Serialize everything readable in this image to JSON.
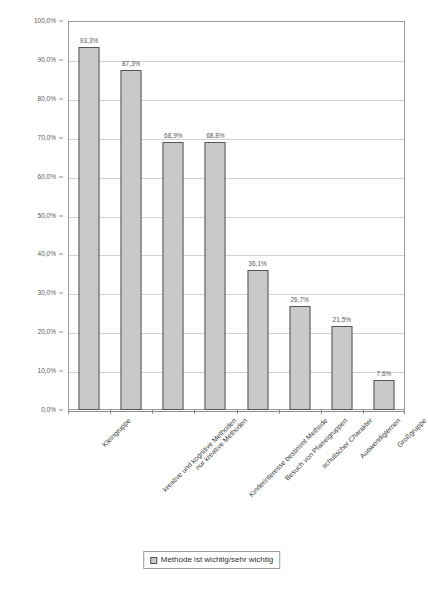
{
  "chart_data": {
    "type": "bar",
    "title": "",
    "subtitle": "",
    "xlabel": "",
    "ylabel": "",
    "ylim": [
      0,
      100
    ],
    "grid": true,
    "legend_position": "bottom",
    "value_suffix": "%",
    "decimal_separator": ",",
    "categories": [
      "Kleingruppe",
      "kreative und kognitive Methoden",
      "nur kreative Methoden",
      "Kinderinteresse bestimmt Methode",
      "Besuch von Pfarreigruppen",
      "schulischer Charakter",
      "Auswendiglernen",
      "Großgruppe"
    ],
    "values": [
      93.3,
      87.3,
      68.9,
      68.8,
      36.1,
      26.7,
      21.5,
      7.6
    ],
    "value_labels": [
      "93,3%",
      "87,3%",
      "68,9%",
      "68,8%",
      "36,1%",
      "26,7%",
      "21,5%",
      "7,6%"
    ],
    "series": [
      {
        "name": "Methode ist wichtig/sehr wichtig",
        "values": [
          93.3,
          87.3,
          68.9,
          68.8,
          36.1,
          26.7,
          21.5,
          7.6
        ],
        "color": "#c9c9c9",
        "border_color": "#555555"
      }
    ],
    "y_ticks": [
      0,
      10,
      20,
      30,
      40,
      50,
      60,
      70,
      80,
      90,
      100
    ],
    "y_tick_labels": [
      "0,0%",
      "10,0%",
      "20,0%",
      "30,0%",
      "40,0%",
      "50,0%",
      "60,0%",
      "70,0%",
      "80,0%",
      "90,0%",
      "100,0%"
    ],
    "legend": [
      {
        "label": "Methode ist wichtig/sehr wichtig",
        "color": "#c9c9c9"
      }
    ],
    "colors": {
      "bar_fill": "#c9c9c9",
      "bar_border": "#555555",
      "gridline": "#d2d2d2",
      "axis": "#8c8c8c",
      "plot_border": "#9a9a9a",
      "text": "#4a4a4a",
      "background": "#ffffff"
    }
  }
}
